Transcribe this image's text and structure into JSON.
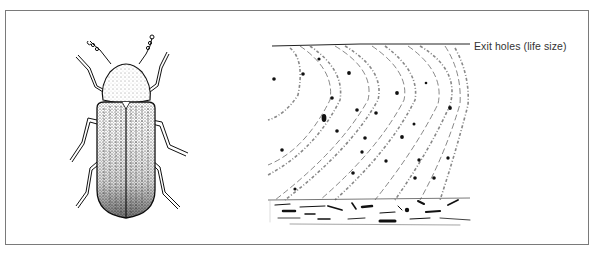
{
  "figure": {
    "caption": "Exit holes (life size)",
    "subjects": [
      {
        "name": "beetle",
        "description": "adult wood-boring beetle, dorsal view"
      },
      {
        "name": "wood-sample",
        "description": "wood surface with beetle exit holes, end grain strip below"
      }
    ],
    "exit_hole_count": 25,
    "colors": {
      "ink": "#111111",
      "frame": "#7a7a7a",
      "paper": "#ffffff"
    }
  }
}
